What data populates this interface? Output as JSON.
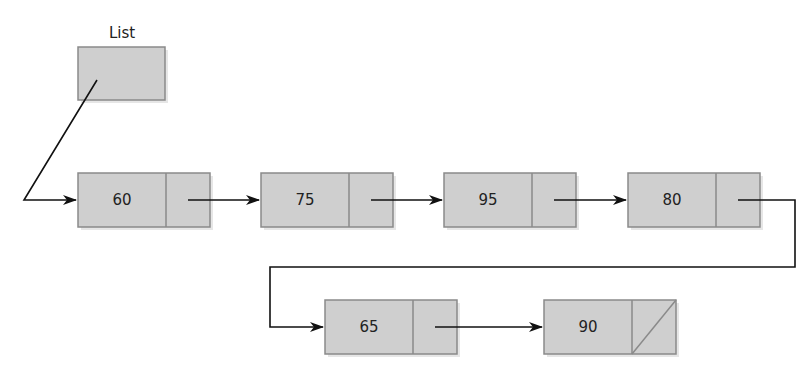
{
  "head": {
    "label": "List"
  },
  "colors": {
    "box_fill": "#cfcfcf",
    "box_stroke": "#8a8a8a",
    "line": "#111111",
    "shadow": "#e6e6e6"
  },
  "nodes": [
    {
      "value": "60",
      "next": "75"
    },
    {
      "value": "75",
      "next": "95"
    },
    {
      "value": "95",
      "next": "80"
    },
    {
      "value": "80",
      "next": "65"
    },
    {
      "value": "65",
      "next": "90"
    },
    {
      "value": "90",
      "next": null
    }
  ]
}
